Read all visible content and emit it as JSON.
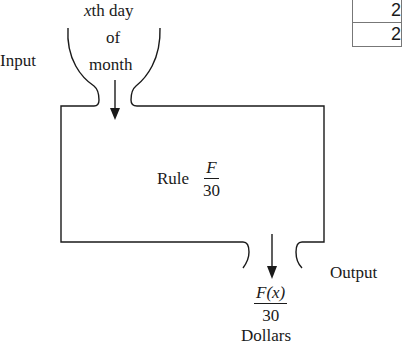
{
  "diagram": {
    "input_label": "Input",
    "input_text": {
      "line1_var": "x",
      "line1_rest": "th day",
      "line2": "of",
      "line3": "month"
    },
    "rule": {
      "label": "Rule",
      "numerator": "F",
      "denominator": "30"
    },
    "output_label": "Output",
    "output_value": {
      "numerator": "F(x)",
      "denominator": "30",
      "unit": "Dollars"
    }
  },
  "table_fragment": {
    "rows": [
      "2",
      "2"
    ]
  }
}
